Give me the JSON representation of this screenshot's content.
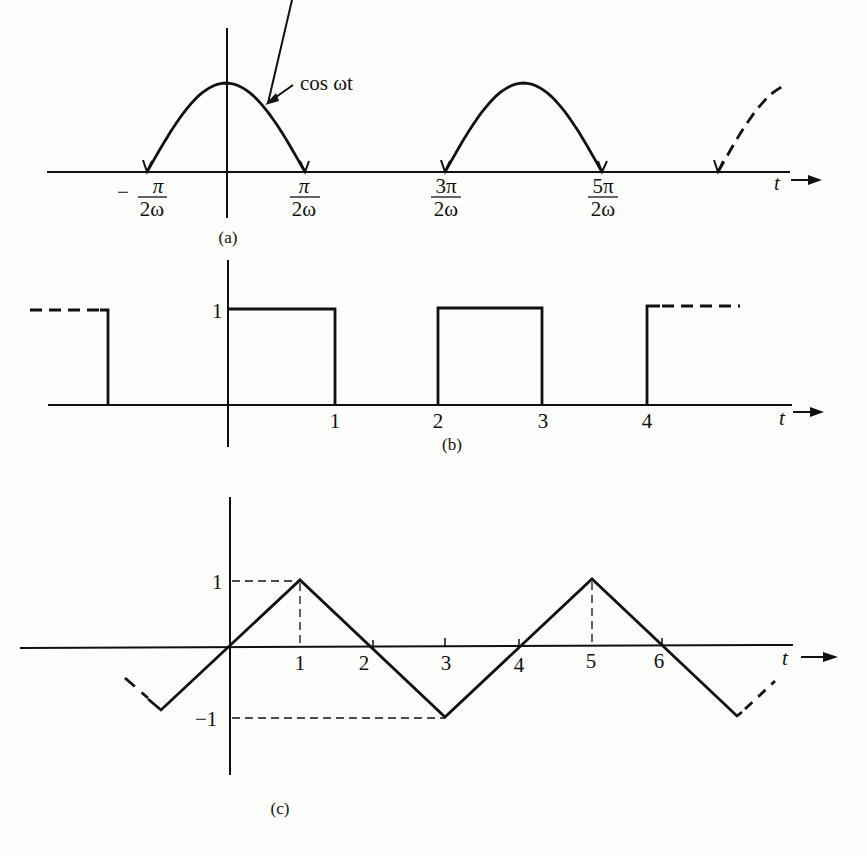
{
  "panels": [
    {
      "id": "a",
      "caption": "(a)",
      "function_label": "cos ωt",
      "axis_label": "t",
      "description": "positive half-cycles of cos ωt",
      "tick_labels": [
        {
          "num": "π",
          "den": "2ω",
          "sign": "−"
        },
        {
          "num": "π",
          "den": "2ω",
          "sign": ""
        },
        {
          "num": "3π",
          "den": "2ω",
          "sign": ""
        },
        {
          "num": "5π",
          "den": "2ω",
          "sign": ""
        }
      ]
    },
    {
      "id": "b",
      "caption": "(b)",
      "axis_label": "t",
      "y_label": "1",
      "tick_labels": [
        "1",
        "2",
        "3",
        "4"
      ],
      "description": "square pulse train, value 1 on [0,1], [2,3], [4,...)"
    },
    {
      "id": "c",
      "caption": "(c)",
      "axis_label": "t",
      "y_labels": [
        "1",
        "−1"
      ],
      "tick_labels": [
        "1",
        "2",
        "3",
        "4",
        "5",
        "6"
      ],
      "description": "triangle wave with peaks 1 at t=1,5 and troughs −1 at t=−1,3,7"
    }
  ],
  "chart_data": [
    {
      "type": "line",
      "title": "(a)",
      "xlabel": "t",
      "series": [
        {
          "name": "cos ωt (positive half-cycles)",
          "x_zeros_units_of_pi_over_2w": [
            -1,
            1,
            3,
            5,
            7
          ],
          "peak": 1
        }
      ]
    },
    {
      "type": "line",
      "title": "(b)",
      "xlabel": "t",
      "x": [
        -1,
        -1,
        0,
        0,
        1,
        1,
        2,
        2,
        3,
        3,
        4,
        4,
        5
      ],
      "series": [
        {
          "name": "square wave",
          "values": [
            1,
            0,
            0,
            1,
            1,
            0,
            0,
            1,
            1,
            0,
            0,
            1,
            1
          ]
        }
      ],
      "ylim": [
        0,
        1
      ]
    },
    {
      "type": "line",
      "title": "(c)",
      "xlabel": "t",
      "x": [
        -1,
        1,
        3,
        5,
        7
      ],
      "series": [
        {
          "name": "triangle wave",
          "values": [
            -1,
            1,
            -1,
            1,
            -1
          ]
        }
      ],
      "ylim": [
        -1,
        1
      ]
    }
  ]
}
